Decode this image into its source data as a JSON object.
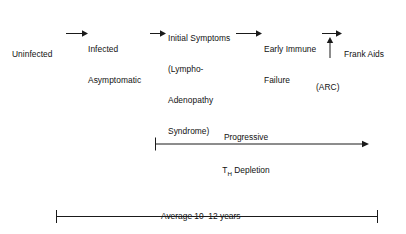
{
  "diagram": {
    "stroke_color": "#1a1a1a",
    "text_color": "#111111",
    "background_color": "#ffffff",
    "stages": [
      {
        "id": "uninfected",
        "lines": [
          "Uninfected"
        ]
      },
      {
        "id": "infected-asymptomatic",
        "lines": [
          "Infected",
          "Asymptomatic"
        ]
      },
      {
        "id": "initial-symptoms",
        "lines": [
          "Initial Symptoms",
          "(Lympho-",
          "Adenopathy",
          "Syndrome)"
        ]
      },
      {
        "id": "early-immune-failure",
        "lines": [
          "Early Immune",
          "Failure"
        ]
      },
      {
        "id": "frank-aids",
        "lines": [
          "Frank Aids"
        ]
      }
    ],
    "annotation": {
      "id": "arc",
      "label": "(ARC)"
    },
    "depletion": {
      "line1": "Progressive",
      "line2_prefix": "T",
      "line2_subscript": "H",
      "line2_suffix": " Depletion"
    },
    "duration": {
      "label": "Average 10–12 years"
    }
  }
}
